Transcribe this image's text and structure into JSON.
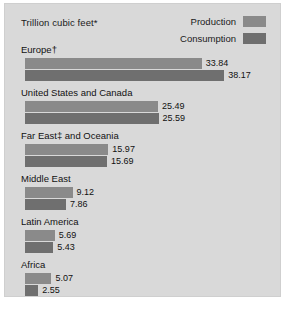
{
  "chart_data": {
    "type": "bar",
    "title": "Trillion cubic feet*",
    "orientation": "horizontal",
    "xlabel": "",
    "ylabel": "",
    "xlim": [
      0,
      40
    ],
    "grid": false,
    "legend_position": "top-right",
    "categories": [
      "Europe†",
      "United States and Canada",
      "Far East‡ and Oceania",
      "Middle East",
      "Latin America",
      "Africa"
    ],
    "series": [
      {
        "name": "Production",
        "color": "#8a8a8a",
        "values": [
          33.84,
          25.49,
          15.97,
          9.12,
          5.69,
          5.07
        ]
      },
      {
        "name": "Consumption",
        "color": "#6f6f6f",
        "values": [
          38.17,
          25.59,
          15.69,
          7.86,
          5.43,
          2.55
        ]
      }
    ],
    "value_labels": [
      [
        "33.84",
        "38.17"
      ],
      [
        "25.49",
        "25.59"
      ],
      [
        "15.97",
        "15.69"
      ],
      [
        "9.12",
        "7.86"
      ],
      [
        "5.69",
        "5.43"
      ],
      [
        "5.07",
        "2.55"
      ]
    ]
  },
  "legend": {
    "items": [
      {
        "label": "Production",
        "color": "#8a8a8a"
      },
      {
        "label": "Consumption",
        "color": "#6f6f6f"
      }
    ]
  },
  "panel": {
    "background": "#d9d9d9",
    "border": "#cfcfcf"
  }
}
